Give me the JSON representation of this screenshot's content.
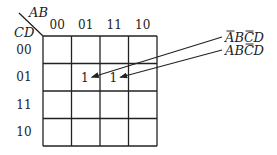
{
  "kmap": {
    "row_variable": "CD",
    "col_variable": "AB",
    "col_headers": [
      "00",
      "01",
      "11",
      "10"
    ],
    "row_headers": [
      "00",
      "01",
      "11",
      "10"
    ],
    "cells": [
      [
        "",
        "",
        "",
        ""
      ],
      [
        "",
        "1",
        "1",
        ""
      ],
      [
        "",
        "",
        "",
        ""
      ],
      [
        "",
        "",
        "",
        ""
      ]
    ]
  },
  "annotations": [
    {
      "target_row": 1,
      "target_col": 1,
      "terms": [
        {
          "letter": "A",
          "bar": true
        },
        {
          "letter": "B",
          "bar": false
        },
        {
          "letter": "C",
          "bar": true
        },
        {
          "letter": "D",
          "bar": false
        }
      ]
    },
    {
      "target_row": 1,
      "target_col": 2,
      "terms": [
        {
          "letter": "A",
          "bar": false
        },
        {
          "letter": "B",
          "bar": false
        },
        {
          "letter": "C",
          "bar": true
        },
        {
          "letter": "D",
          "bar": false
        }
      ]
    }
  ]
}
